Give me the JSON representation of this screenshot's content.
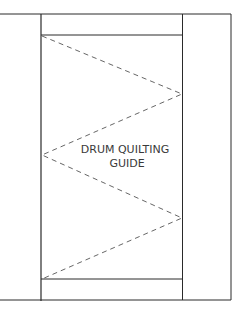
{
  "diagram": {
    "label_line1": "DRUM QUILTING",
    "label_line2": "GUIDE",
    "colors": {
      "line": "#2a2a2a",
      "dashed": "#555555",
      "text": "#3a3a3a",
      "background": "#ffffff"
    }
  }
}
